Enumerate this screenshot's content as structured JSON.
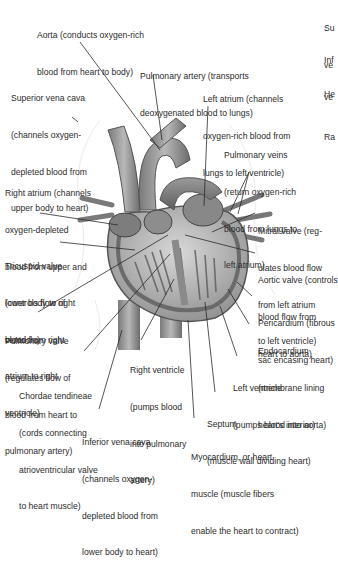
{
  "figure": {
    "labels": [
      {
        "id": "aorta",
        "lines": [
          "Aorta (conducts oxygen-rich",
          "blood from heart to body)"
        ]
      },
      {
        "id": "pulmonary-artery",
        "lines": [
          "Pulmonary artery (transports",
          "deoxygenated blood to lungs)"
        ]
      },
      {
        "id": "superior-vena-cava",
        "lines": [
          "Superior vena cava",
          "(channels oxygen-",
          "depleted blood from",
          "upper body to heart)"
        ]
      },
      {
        "id": "left-atrium",
        "lines": [
          "Left atrium (channels",
          "oxygen-rich blood from",
          "lungs to left ventricle)"
        ]
      },
      {
        "id": "pulmonary-veins",
        "lines": [
          "Pulmonary veins",
          "(return oxygen-rich",
          "blood from lungs to",
          "left atrium)"
        ]
      },
      {
        "id": "right-atrium",
        "lines": [
          "Right atrium (channels",
          "oxygen-depleted",
          "blood from upper and",
          "lower body to right",
          "ventricle)"
        ]
      },
      {
        "id": "mitral-valve",
        "lines": [
          "Mitral valve (reg-",
          "ulates blood flow",
          "from left atrium",
          "to left ventricle)"
        ]
      },
      {
        "id": "tricuspid-valve",
        "lines": [
          "Tricuspid valve",
          "(controls flow of",
          "blood from right",
          "atrium to right",
          "ventricle)"
        ]
      },
      {
        "id": "aortic-valve",
        "lines": [
          "Aortic valve (controls",
          "blood flow from",
          "heart to aorta)"
        ]
      },
      {
        "id": "pericardium",
        "lines": [
          "Pericardium (fibrous",
          "sac encasing heart)"
        ]
      },
      {
        "id": "pulmonary-valve",
        "lines": [
          "Pulmonary valve",
          "(regulates flow of",
          "blood from heart to",
          "pulmonary artery)"
        ]
      },
      {
        "id": "endocardium",
        "lines": [
          "Endocardium",
          "(membrane lining",
          "heart's interior)"
        ]
      },
      {
        "id": "right-ventricle",
        "lines": [
          "Right ventricle",
          "(pumps blood",
          "into pulmonary",
          "artery)"
        ]
      },
      {
        "id": "left-ventricle",
        "lines": [
          "Left ventricle",
          "(pumps blood into aorta)"
        ]
      },
      {
        "id": "chordae-tendineae",
        "lines": [
          "Chordae tendineae",
          "(cords connecting",
          "atrioventricular valve",
          "to heart muscle)"
        ]
      },
      {
        "id": "septum",
        "lines": [
          "Septum",
          "(muscle wall dividing heart)"
        ]
      },
      {
        "id": "inferior-vena-cava",
        "lines": [
          "Inferior vena cava",
          "(channels oxygen-",
          "depleted blood from",
          "lower body to heart)"
        ]
      },
      {
        "id": "myocardium",
        "lines": [
          "Myocardium, or heart",
          "muscle (muscle fibers",
          "enable the heart to contract)"
        ]
      }
    ],
    "edge_fragments": [
      {
        "id": "edge-su",
        "lines": [
          "Su",
          "ve"
        ]
      },
      {
        "id": "edge-inf",
        "lines": [
          "Inf",
          "ve"
        ]
      },
      {
        "id": "edge-he",
        "lines": [
          "He"
        ]
      },
      {
        "id": "edge-ra",
        "lines": [
          "Ra"
        ]
      }
    ]
  }
}
